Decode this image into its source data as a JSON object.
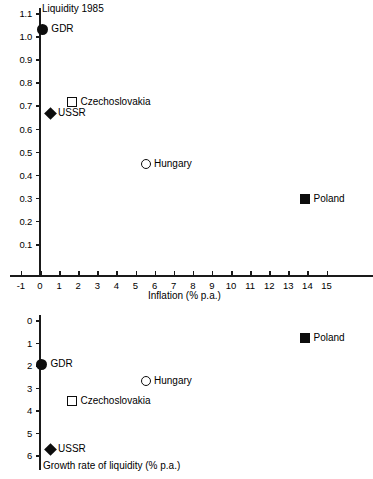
{
  "chart_data": [
    {
      "type": "scatter",
      "title": "Liquidity 1985",
      "xlabel": "Inflation (% p.a.)",
      "ylabel": "Liquidity 1985",
      "xlim": [
        -1,
        15
      ],
      "ylim": [
        0,
        1.15
      ],
      "grid": false,
      "legend": "inline-labels",
      "y_inverted": false,
      "xticks": [
        "-1",
        "0",
        "1",
        "2",
        "3",
        "4",
        "5",
        "6",
        "7",
        "8",
        "9",
        "10",
        "11",
        "12",
        "13",
        "14",
        "15"
      ],
      "xtick_values": [
        -1,
        0,
        1,
        2,
        3,
        4,
        5,
        6,
        7,
        8,
        9,
        10,
        11,
        12,
        13,
        14,
        15
      ],
      "yticks": [
        "0.1",
        "0.2",
        "0.3",
        "0.4",
        "0.5",
        "0.6",
        "0.7",
        "0.8",
        "0.9",
        "1.0",
        "1.1"
      ],
      "ytick_values": [
        0.1,
        0.2,
        0.3,
        0.4,
        0.5,
        0.6,
        0.7,
        0.8,
        0.9,
        1.0,
        1.1
      ],
      "points": [
        {
          "label": "GDR",
          "x": 0.15,
          "y": 1.03,
          "marker": "circle-filled"
        },
        {
          "label": "Czechoslovakia",
          "x": 1.7,
          "y": 0.715,
          "marker": "square-open"
        },
        {
          "label": "USSR",
          "x": 0.55,
          "y": 0.665,
          "marker": "diamond-filled"
        },
        {
          "label": "Hungary",
          "x": 5.55,
          "y": 0.445,
          "marker": "circle-open"
        },
        {
          "label": "Poland",
          "x": 13.9,
          "y": 0.295,
          "marker": "square-filled"
        }
      ]
    },
    {
      "type": "scatter",
      "title": "Growth rate of liquidity (% p.a.)",
      "xlabel": "",
      "ylabel": "Growth rate of liquidity (% p.a.)",
      "xlim": [
        -1,
        15
      ],
      "ylim": [
        0,
        6.4
      ],
      "grid": false,
      "legend": "inline-labels",
      "y_inverted": true,
      "yticks": [
        "0",
        "1",
        "2",
        "3",
        "4",
        "5",
        "6"
      ],
      "ytick_values": [
        0,
        1,
        2,
        3,
        4,
        5,
        6
      ],
      "points": [
        {
          "label": "Poland",
          "x": 13.9,
          "y": 0.8,
          "marker": "square-filled"
        },
        {
          "label": "GDR",
          "x": 0.1,
          "y": 1.97,
          "marker": "circle-filled"
        },
        {
          "label": "Hungary",
          "x": 5.55,
          "y": 2.72,
          "marker": "circle-open"
        },
        {
          "label": "Czechoslovakia",
          "x": 1.7,
          "y": 3.62,
          "marker": "square-open"
        },
        {
          "label": "USSR",
          "x": 0.55,
          "y": 5.75,
          "marker": "diamond-filled"
        }
      ]
    }
  ],
  "top": {
    "title": "Liquidity 1985",
    "xaxis_title": "Inflation (% p.a.)"
  },
  "bottom": {
    "axis_title": "Growth rate of liquidity (% p.a.)"
  }
}
